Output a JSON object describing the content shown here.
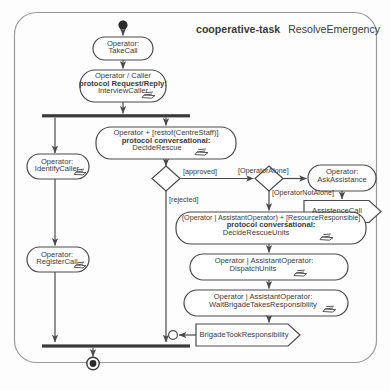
{
  "diagram": {
    "title_keyword": "cooperative-task",
    "title_name": "ResolveEmergency",
    "type": "uml-activity-diagram",
    "stroke_color": "#4a4a4a",
    "text_color": "#3a3a3a",
    "background_color": "#fdfdfd"
  },
  "nodes": {
    "start": {
      "name": "initial-node",
      "label": ""
    },
    "take_call": {
      "line1": "Operator:",
      "line2": "TakeCall"
    },
    "interview_caller": {
      "line1": "Operator / Caller",
      "line2": "protocol Request/Reply:",
      "line3": "InterviewCaller"
    },
    "decide_rescue": {
      "line1": "Operator + [restof(CentreStaff)]",
      "line2": "protocol conversational:",
      "line3": "DecideRescue"
    },
    "identify_caller": {
      "line1": "Operator:",
      "line2": "IdentifyCaller"
    },
    "register_call": {
      "line1": "Operator:",
      "line2": "RegisterCall"
    },
    "ask_assistance": {
      "line1": "Operator:",
      "line2": "AskAssistance"
    },
    "assistence_call": {
      "label": "AssistenceCall"
    },
    "decide_rescue_units": {
      "line1": "(Operator | AssistantOperator) + [ResourceResponsible]",
      "line2": "protocol conversational:",
      "line3": "DecideRescueUnits"
    },
    "dispatch_units": {
      "line1": "Operator | AssistantOperator:",
      "line2": "DispatchUnits"
    },
    "wait_brigade": {
      "line1": "Operator | AssistantOperator:",
      "line2": "WaitBrigadeTakesResponsibility"
    },
    "brigade_took_responsibility": {
      "label": "BrigadeTookResponsibility"
    },
    "final": {
      "name": "final-node",
      "label": ""
    }
  },
  "guards": {
    "approved": "[approved]",
    "rejected": "[rejected]",
    "operator_alone": "[OperatorAlone]",
    "operator_not_alone": "[OperatorNotAlone]"
  },
  "icons": {
    "manual_task": "manual-task-hand-icon",
    "fork_bar": "fork-bar-icon",
    "join_bar": "join-bar-icon",
    "decision": "decision-diamond-icon",
    "merge_junction": "merge-junction-icon",
    "send_signal": "send-signal-icon",
    "receive_signal": "receive-signal-icon"
  }
}
